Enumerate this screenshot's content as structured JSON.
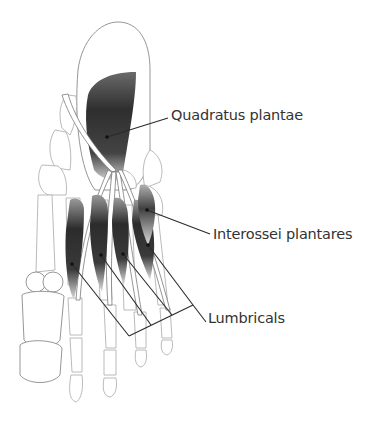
{
  "figure": {
    "labels": [
      {
        "id": "quadratus-plantae",
        "text": "Quadratus plantae",
        "x": 171,
        "y": 107
      },
      {
        "id": "interossei-plantares",
        "text": "Interossei plantares",
        "x": 213,
        "y": 226
      },
      {
        "id": "lumbricals",
        "text": "Lumbricals",
        "x": 208,
        "y": 310
      }
    ],
    "colors": {
      "background": "#ffffff",
      "label_text": "#333333",
      "leader_line": "#2a2a2a",
      "muscle_dark": "#2b2b2b",
      "bone_outline": "#8a8a8a"
    }
  }
}
